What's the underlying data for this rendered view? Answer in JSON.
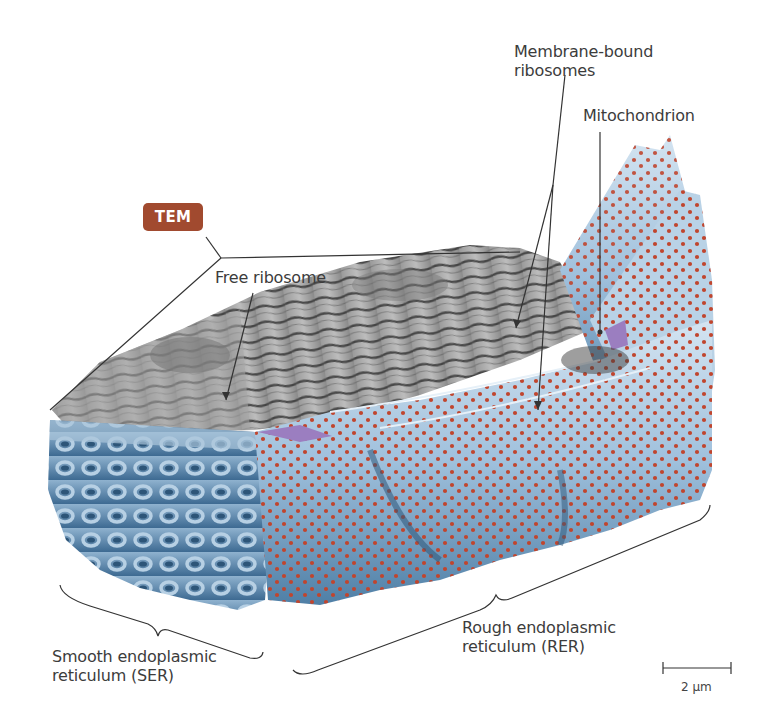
{
  "figure": {
    "type": "illustration",
    "badge": {
      "label": "TEM",
      "color": "#a14a2f"
    },
    "labels": {
      "membrane_bound_ribosomes": {
        "line1": "Membrane-bound",
        "line2": "ribosomes"
      },
      "mitochondrion": {
        "line1": "Mitochondrion"
      },
      "free_ribosome": {
        "line1": "Free ribosome"
      },
      "smooth_er": {
        "line1": "Smooth endoplasmic",
        "line2": "reticulum (SER)"
      },
      "rough_er": {
        "line1": "Rough endoplasmic",
        "line2": "reticulum (RER)"
      }
    },
    "scale_bar": {
      "label": "2 µm"
    },
    "colors": {
      "ser_blue": "#4f7fa6",
      "rer_blue": "#6f9dc4",
      "rer_light": "#c9dcec",
      "ribosome_dot": "#c0452e",
      "tem_gray": "#8a8a8a",
      "mitochondrion_purple": "#9b7ec0",
      "leader_line": "#333333"
    }
  }
}
